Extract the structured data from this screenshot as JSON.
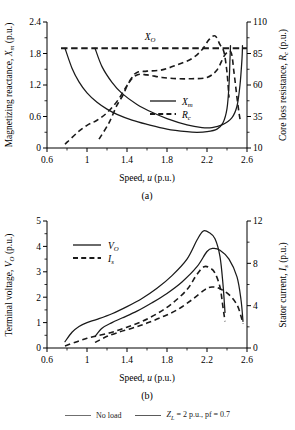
{
  "figure": {
    "charts": [
      {
        "id": "chart-a",
        "caption": "(a)",
        "xlabel_pre": "Speed, ",
        "xlabel_var": "u",
        "xlabel_post": " (p.u.)",
        "ylabel_left_pre": "Magnetizing reactance, ",
        "ylabel_left_var": "X",
        "ylabel_left_sub": "m",
        "ylabel_left_post": " (p.u.)",
        "ylabel_right_pre": "Core loss resistance, ",
        "ylabel_right_var": "R",
        "ylabel_right_sub": "c",
        "ylabel_right_post": " (p.u.)",
        "annotation": {
          "var": "X",
          "sub": "O"
        },
        "legend": [
          {
            "name": "Xm",
            "var": "X",
            "sub": "m",
            "style": "solid"
          },
          {
            "name": "Rc",
            "var": "R",
            "sub": "c",
            "style": "dashed"
          }
        ],
        "chart_data": {
          "type": "line",
          "title": "",
          "xlabel": "Speed, u (p.u.)",
          "ylabel": "Magnetizing reactance, Xm (p.u.)",
          "ylabel_right": "Core loss resistance, Rc (p.u.)",
          "xlim": [
            0.6,
            2.6
          ],
          "ylim": [
            0,
            2.4
          ],
          "ylim_right": [
            10,
            110
          ],
          "xticks": [
            0.6,
            1,
            1.4,
            1.8,
            2.2,
            2.6
          ],
          "yticks": [
            0,
            0.6,
            1.2,
            1.8,
            2.4
          ],
          "yticks_right": [
            10,
            35,
            60,
            85,
            110
          ],
          "grid": false,
          "legend_position": "center-right",
          "annotations": [
            {
              "text": "XO",
              "x": 1.52,
              "y": 2.02,
              "note": "label for constant unsaturated reactance line"
            }
          ],
          "series": [
            {
              "name": "XO (unsaturated reactance)",
              "axis": "left",
              "style": "dashed",
              "points": [
                [
                  0.74,
                  1.9
                ],
                [
                  2.6,
                  1.9
                ]
              ]
            },
            {
              "name": "Xm no load",
              "axis": "left",
              "style": "solid",
              "points": [
                [
                  0.78,
                  1.9
                ],
                [
                  0.85,
                  1.52
                ],
                [
                  0.92,
                  1.26
                ],
                [
                  1.0,
                  1.05
                ],
                [
                  1.1,
                  0.87
                ],
                [
                  1.2,
                  0.74
                ],
                [
                  1.3,
                  0.64
                ],
                [
                  1.45,
                  0.53
                ],
                [
                  1.6,
                  0.45
                ],
                [
                  1.8,
                  0.36
                ],
                [
                  2.0,
                  0.31
                ],
                [
                  2.1,
                  0.3
                ],
                [
                  2.2,
                  0.31
                ],
                [
                  2.3,
                  0.36
                ],
                [
                  2.36,
                  0.48
                ],
                [
                  2.4,
                  0.75
                ],
                [
                  2.42,
                  1.2
                ],
                [
                  2.43,
                  1.7
                ],
                [
                  2.435,
                  1.95
                ]
              ]
            },
            {
              "name": "Xm loaded ZL=2 pf=0.7",
              "axis": "left",
              "style": "solid",
              "points": [
                [
                  1.08,
                  1.9
                ],
                [
                  1.15,
                  1.55
                ],
                [
                  1.25,
                  1.25
                ],
                [
                  1.35,
                  1.04
                ],
                [
                  1.5,
                  0.83
                ],
                [
                  1.65,
                  0.68
                ],
                [
                  1.8,
                  0.56
                ],
                [
                  2.0,
                  0.44
                ],
                [
                  2.15,
                  0.39
                ],
                [
                  2.25,
                  0.39
                ],
                [
                  2.35,
                  0.44
                ],
                [
                  2.45,
                  0.58
                ],
                [
                  2.5,
                  0.8
                ],
                [
                  2.53,
                  1.2
                ],
                [
                  2.55,
                  1.7
                ],
                [
                  2.555,
                  1.95
                ]
              ]
            },
            {
              "name": "Rc no load",
              "axis": "right",
              "style": "dashed",
              "points": [
                [
                  0.78,
                  13
                ],
                [
                  0.9,
                  22
                ],
                [
                  1.0,
                  28
                ],
                [
                  1.1,
                  32
                ],
                [
                  1.2,
                  38
                ],
                [
                  1.3,
                  47
                ],
                [
                  1.38,
                  57
                ],
                [
                  1.45,
                  66
                ],
                [
                  1.5,
                  70
                ],
                [
                  1.6,
                  71
                ],
                [
                  1.75,
                  72
                ],
                [
                  1.9,
                  76
                ],
                [
                  2.05,
                  81
                ],
                [
                  2.15,
                  88
                ],
                [
                  2.22,
                  96
                ],
                [
                  2.28,
                  99
                ],
                [
                  2.33,
                  92
                ],
                [
                  2.37,
                  86
                ],
                [
                  2.4,
                  70
                ],
                [
                  2.42,
                  50
                ]
              ]
            },
            {
              "name": "Rc loaded ZL=2 pf=0.7",
              "axis": "right",
              "style": "dashed",
              "points": [
                [
                  1.12,
                  17
                ],
                [
                  1.22,
                  30
                ],
                [
                  1.3,
                  44
                ],
                [
                  1.36,
                  52
                ],
                [
                  1.42,
                  62
                ],
                [
                  1.5,
                  68
                ],
                [
                  1.6,
                  68
                ],
                [
                  1.75,
                  66
                ],
                [
                  1.9,
                  65
                ],
                [
                  2.05,
                  65
                ],
                [
                  2.2,
                  66
                ],
                [
                  2.3,
                  72
                ],
                [
                  2.38,
                  84
                ],
                [
                  2.44,
                  86
                ],
                [
                  2.47,
                  70
                ],
                [
                  2.5,
                  50
                ],
                [
                  2.52,
                  38
                ],
                [
                  2.53,
                  33
                ]
              ]
            }
          ]
        }
      },
      {
        "id": "chart-b",
        "caption": "(b)",
        "xlabel_pre": "Speed, ",
        "xlabel_var": "u",
        "xlabel_post": " (p.u.)",
        "ylabel_left_pre": "Terminal voltage, ",
        "ylabel_left_var": "V",
        "ylabel_left_sub": "O",
        "ylabel_left_post": " (p.u.)",
        "ylabel_right_pre": "Stator current, ",
        "ylabel_right_var": "I",
        "ylabel_right_sub": "s",
        "ylabel_right_post": " (p.u.)",
        "legend": [
          {
            "name": "VO",
            "var": "V",
            "sub": "O",
            "style": "solid"
          },
          {
            "name": "Is",
            "var": "I",
            "sub": "s",
            "style": "dashed"
          }
        ],
        "chart_data": {
          "type": "line",
          "title": "",
          "xlabel": "Speed, u (p.u.)",
          "ylabel": "Terminal voltage, VO (p.u.)",
          "ylabel_right": "Stator current, Is (p.u.)",
          "xlim": [
            0.6,
            2.6
          ],
          "ylim": [
            0,
            5
          ],
          "ylim_right": [
            0,
            12
          ],
          "xticks": [
            0.6,
            1,
            1.4,
            1.8,
            2.2,
            2.6
          ],
          "yticks": [
            0,
            1,
            2,
            3,
            4,
            5
          ],
          "yticks_right": [
            0,
            4,
            8,
            12
          ],
          "grid": false,
          "legend_position": "upper-left",
          "series": [
            {
              "name": "VO no load",
              "axis": "left",
              "style": "solid",
              "points": [
                [
                  0.78,
                  0.25
                ],
                [
                  0.85,
                  0.62
                ],
                [
                  0.92,
                  0.85
                ],
                [
                  1.0,
                  1.0
                ],
                [
                  1.1,
                  1.13
                ],
                [
                  1.25,
                  1.35
                ],
                [
                  1.4,
                  1.63
                ],
                [
                  1.55,
                  1.95
                ],
                [
                  1.7,
                  2.35
                ],
                [
                  1.85,
                  2.85
                ],
                [
                  2.0,
                  3.5
                ],
                [
                  2.1,
                  4.25
                ],
                [
                  2.16,
                  4.6
                ],
                [
                  2.22,
                  4.55
                ],
                [
                  2.28,
                  4.3
                ],
                [
                  2.33,
                  3.6
                ],
                [
                  2.36,
                  2.5
                ],
                [
                  2.38,
                  1.4
                ]
              ]
            },
            {
              "name": "VO loaded ZL=2 pf=0.7",
              "axis": "left",
              "style": "solid",
              "points": [
                [
                  1.08,
                  0.45
                ],
                [
                  1.15,
                  0.78
                ],
                [
                  1.25,
                  1.0
                ],
                [
                  1.35,
                  1.18
                ],
                [
                  1.5,
                  1.45
                ],
                [
                  1.65,
                  1.78
                ],
                [
                  1.8,
                  2.15
                ],
                [
                  1.95,
                  2.6
                ],
                [
                  2.1,
                  3.2
                ],
                [
                  2.2,
                  3.8
                ],
                [
                  2.26,
                  3.92
                ],
                [
                  2.33,
                  3.85
                ],
                [
                  2.42,
                  3.5
                ],
                [
                  2.5,
                  2.8
                ],
                [
                  2.54,
                  1.9
                ],
                [
                  2.56,
                  1.05
                ]
              ]
            },
            {
              "name": "Is no load",
              "axis": "left",
              "style": "dashed",
              "points": [
                [
                  0.78,
                  0.08
                ],
                [
                  0.9,
                  0.25
                ],
                [
                  1.0,
                  0.38
                ],
                [
                  1.1,
                  0.48
                ],
                [
                  1.25,
                  0.62
                ],
                [
                  1.4,
                  0.82
                ],
                [
                  1.55,
                  1.05
                ],
                [
                  1.7,
                  1.35
                ],
                [
                  1.85,
                  1.75
                ],
                [
                  2.0,
                  2.3
                ],
                [
                  2.1,
                  2.9
                ],
                [
                  2.17,
                  3.2
                ],
                [
                  2.23,
                  3.15
                ],
                [
                  2.28,
                  2.95
                ],
                [
                  2.33,
                  2.4
                ],
                [
                  2.36,
                  1.6
                ],
                [
                  2.38,
                  1.05
                ]
              ]
            },
            {
              "name": "Is loaded ZL=2 pf=0.7",
              "axis": "left",
              "style": "dashed",
              "points": [
                [
                  1.08,
                  0.22
                ],
                [
                  1.18,
                  0.42
                ],
                [
                  1.3,
                  0.6
                ],
                [
                  1.45,
                  0.78
                ],
                [
                  1.6,
                  0.98
                ],
                [
                  1.75,
                  1.22
                ],
                [
                  1.9,
                  1.5
                ],
                [
                  2.05,
                  1.9
                ],
                [
                  2.18,
                  2.3
                ],
                [
                  2.25,
                  2.4
                ],
                [
                  2.32,
                  2.35
                ],
                [
                  2.42,
                  2.1
                ],
                [
                  2.5,
                  1.7
                ],
                [
                  2.54,
                  1.25
                ],
                [
                  2.56,
                  0.95
                ]
              ]
            }
          ]
        }
      }
    ],
    "bottom_legend": [
      {
        "name": "no-load",
        "label": "No load",
        "color": "#6f6f6f"
      },
      {
        "name": "loaded",
        "label": "ZL = 2 p.u., pf = 0.7",
        "var": "Z",
        "sub": "L",
        "rest": " = 2 p.u., pf = 0.7",
        "color": "#6f6f6f"
      }
    ]
  }
}
